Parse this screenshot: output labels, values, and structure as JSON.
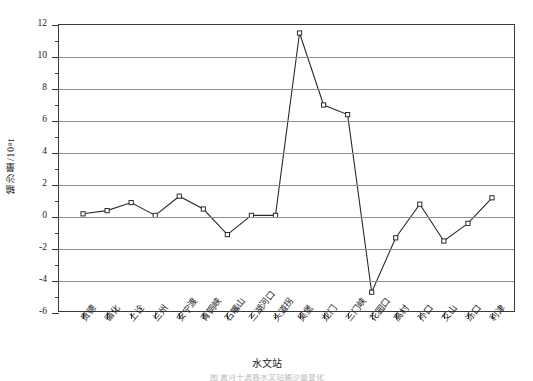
{
  "chart_data": {
    "type": "line",
    "title": "",
    "xlabel": "水文站",
    "ylabel": "输沙量/10⁸t",
    "ylim": [
      -6,
      12
    ],
    "ytick_step": 2,
    "grid": true,
    "grid_axis": "y",
    "legend": "none",
    "marker": "open-square",
    "line_color": "#2b2b2b",
    "categories": [
      "贵德",
      "循化",
      "上诠",
      "兰州",
      "安宁渡",
      "青铜峡",
      "石嘴山",
      "三湖河口",
      "头道拐",
      "吴堡",
      "龙门",
      "三门峡",
      "花园口",
      "高村",
      "孙口",
      "艾山",
      "泺口",
      "利津"
    ],
    "values": [
      0.2,
      0.4,
      0.9,
      0.1,
      1.3,
      0.5,
      -1.1,
      0.1,
      0.1,
      11.5,
      7.0,
      6.4,
      -4.7,
      -1.3,
      0.8,
      -1.5,
      -0.4,
      1.2
    ],
    "ytick_labels": [
      "12",
      "10",
      "8",
      "6",
      "4",
      "2",
      "0",
      "-2",
      "-4",
      "-6"
    ],
    "ytick_values": [
      12,
      10,
      8,
      6,
      4,
      2,
      0,
      -2,
      -4,
      -6
    ],
    "caption": "图 黄河干流各水文站输沙量变化"
  }
}
